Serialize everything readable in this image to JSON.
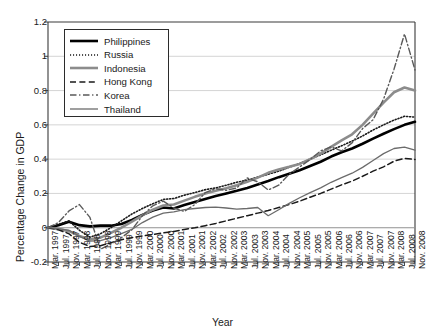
{
  "chart_data": {
    "type": "line",
    "title": "",
    "xlabel": "Year",
    "ylabel": "Percentage Change in GDP",
    "ylim": [
      -0.2,
      1.2
    ],
    "yticks": [
      1.2,
      1,
      0.8,
      0.6,
      0.4,
      0.2,
      0,
      -0.2
    ],
    "ytick_labels": [
      "1.2",
      "1",
      "0.8",
      "0.6",
      "0.4",
      "0.2",
      "0",
      "-0.2"
    ],
    "grid": true,
    "grid_axis": "y",
    "legend_position": "upper-left-inside",
    "categories": [
      "Mar. 1997",
      "Jul. 1997",
      "Nov. 1997",
      "Mar. 1998",
      "Jul. 1998",
      "Nov. 1998",
      "Mar. 1999",
      "Jul. 1999",
      "Nov. 1999",
      "Mar. 2000",
      "Jul. 2000",
      "Nov. 2000",
      "Mar. 2001",
      "Jul. 2001",
      "Nov. 2001",
      "Mar. 2002",
      "Jul. 2002",
      "Nov. 2002",
      "Mar. 2003",
      "Jul. 2003",
      "Nov. 2003",
      "Mar. 2004",
      "Jul. 2004",
      "Nov. 2004",
      "Mar. 2005",
      "Jul. 2005",
      "Nov. 2005",
      "Mar. 2006",
      "Jul. 2006",
      "Nov. 2006",
      "Mar. 2007",
      "Jul. 2007",
      "Nov. 2007",
      "Mar. 2008",
      "Jul. 2008",
      "Nov. 2008"
    ],
    "series": [
      {
        "name": "Philippines",
        "color": "#000000",
        "width": 2.6,
        "dash": "none",
        "values": [
          0.0,
          0.015,
          0.035,
          0.015,
          0.008,
          0.012,
          0.012,
          0.022,
          0.045,
          0.075,
          0.1,
          0.118,
          0.112,
          0.132,
          0.15,
          0.168,
          0.185,
          0.2,
          0.215,
          0.232,
          0.252,
          0.272,
          0.295,
          0.315,
          0.335,
          0.36,
          0.385,
          0.415,
          0.44,
          0.462,
          0.49,
          0.52,
          0.548,
          0.575,
          0.6,
          0.618
        ]
      },
      {
        "name": "Russia",
        "color": "#1a1a1a",
        "width": 1.6,
        "dash": "dotted",
        "values": [
          0.0,
          0.02,
          0.04,
          -0.015,
          -0.055,
          -0.035,
          0.0,
          0.04,
          0.08,
          0.112,
          0.14,
          0.165,
          0.17,
          0.19,
          0.205,
          0.222,
          0.232,
          0.248,
          0.265,
          0.278,
          0.295,
          0.312,
          0.33,
          0.352,
          0.375,
          0.4,
          0.425,
          0.452,
          0.478,
          0.505,
          0.535,
          0.57,
          0.6,
          0.628,
          0.65,
          0.645
        ]
      },
      {
        "name": "Indonesia",
        "color": "#8c8c8c",
        "width": 2.6,
        "dash": "none",
        "values": [
          0.0,
          -0.008,
          -0.02,
          -0.048,
          -0.068,
          -0.058,
          -0.03,
          0.0,
          0.035,
          0.072,
          0.105,
          0.13,
          0.135,
          0.158,
          0.18,
          0.2,
          0.215,
          0.23,
          0.248,
          0.268,
          0.292,
          0.32,
          0.34,
          0.355,
          0.372,
          0.4,
          0.432,
          0.472,
          0.51,
          0.545,
          0.6,
          0.665,
          0.73,
          0.79,
          0.818,
          0.8
        ]
      },
      {
        "name": "Hong Kong",
        "color": "#1a1a1a",
        "width": 1.5,
        "dash": "dash",
        "values": [
          0.0,
          -0.012,
          -0.035,
          -0.085,
          -0.11,
          -0.105,
          -0.088,
          -0.07,
          -0.058,
          -0.048,
          -0.04,
          -0.03,
          -0.022,
          -0.01,
          0.0,
          0.012,
          0.025,
          0.04,
          0.055,
          0.07,
          0.085,
          0.1,
          0.118,
          0.135,
          0.155,
          0.178,
          0.2,
          0.225,
          0.25,
          0.272,
          0.3,
          0.33,
          0.355,
          0.388,
          0.405,
          0.398
        ]
      },
      {
        "name": "Korea",
        "color": "#5a5a5a",
        "width": 1.4,
        "dash": "dashdot",
        "values": [
          0.0,
          0.03,
          0.098,
          0.135,
          0.06,
          -0.125,
          -0.095,
          -0.058,
          -0.012,
          0.07,
          0.128,
          0.155,
          0.115,
          0.095,
          0.135,
          0.205,
          0.228,
          0.218,
          0.232,
          0.29,
          0.268,
          0.22,
          0.248,
          0.312,
          0.355,
          0.398,
          0.448,
          0.472,
          0.448,
          0.495,
          0.578,
          0.63,
          0.75,
          0.925,
          1.13,
          0.92
        ]
      },
      {
        "name": "Thailand",
        "color": "#6b6b6b",
        "width": 1.3,
        "dash": "none",
        "values": [
          0.0,
          -0.005,
          -0.015,
          -0.05,
          -0.078,
          -0.075,
          -0.058,
          -0.035,
          -0.01,
          0.03,
          0.062,
          0.085,
          0.092,
          0.105,
          0.112,
          0.118,
          0.12,
          0.115,
          0.108,
          0.112,
          0.118,
          0.07,
          0.105,
          0.142,
          0.175,
          0.205,
          0.232,
          0.265,
          0.292,
          0.318,
          0.352,
          0.392,
          0.432,
          0.462,
          0.47,
          0.452
        ]
      }
    ]
  },
  "axis_title": {
    "x": "Year",
    "y": "Percentage Change in GDP"
  }
}
